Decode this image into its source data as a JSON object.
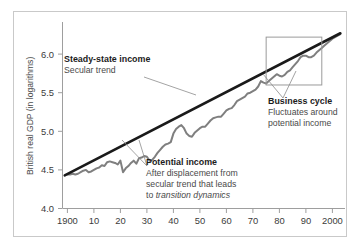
{
  "figure": {
    "background": "#ffffff",
    "frame_color": "#c9c9c9"
  },
  "chart_data": {
    "type": "line",
    "title": "",
    "xlabel": "",
    "ylabel": "British real GDP (in logarithms)",
    "xlim": [
      1897,
      2004
    ],
    "ylim": [
      4.0,
      6.35
    ],
    "grid": false,
    "legend": "none",
    "xticks": [
      1900,
      1910,
      1920,
      1930,
      1940,
      1950,
      1960,
      1970,
      1980,
      1990,
      2000
    ],
    "xtick_labels": [
      "1900",
      "10",
      "20",
      "30",
      "40",
      "50",
      "60",
      "70",
      "80",
      "90",
      "2000"
    ],
    "yticks": [
      4.0,
      4.5,
      5.0,
      5.5,
      6.0
    ],
    "ytick_labels": [
      "4.0",
      "4.5",
      "5.0",
      "5.5",
      "6.0"
    ],
    "series": [
      {
        "name": "Steady-state income",
        "type": "line",
        "color": "#1a1a1a",
        "width": 2.6,
        "x": [
          1899,
          2003
        ],
        "values": [
          4.43,
          6.27
        ]
      },
      {
        "name": "Potential income",
        "type": "line",
        "color": "#7f7f7f",
        "width": 2.0,
        "x": [
          1900,
          1901,
          1902,
          1903,
          1904,
          1905,
          1906,
          1907,
          1908,
          1909,
          1910,
          1911,
          1912,
          1913,
          1914,
          1915,
          1916,
          1917,
          1918,
          1919,
          1920,
          1921,
          1922,
          1923,
          1924,
          1925,
          1926,
          1927,
          1928,
          1929,
          1930,
          1931,
          1932,
          1933,
          1934,
          1935,
          1936,
          1937,
          1938,
          1939,
          1940,
          1941,
          1942,
          1943,
          1944,
          1945,
          1946,
          1947,
          1948,
          1949,
          1950,
          1951,
          1952,
          1953,
          1954,
          1955,
          1956,
          1957,
          1958,
          1959,
          1960,
          1961,
          1962,
          1963,
          1964,
          1965,
          1966,
          1967,
          1968,
          1969,
          1970,
          1971,
          1972,
          1973,
          1974,
          1975,
          1976,
          1977,
          1978,
          1979,
          1980,
          1981,
          1982,
          1983,
          1984,
          1985,
          1986,
          1987,
          1988,
          1989,
          1990,
          1991,
          1992,
          1993,
          1994,
          1995,
          1996,
          1997,
          1998,
          1999,
          2000,
          2001,
          2002,
          2003
        ],
        "values": [
          4.44,
          4.44,
          4.45,
          4.44,
          4.45,
          4.47,
          4.49,
          4.5,
          4.47,
          4.48,
          4.5,
          4.52,
          4.53,
          4.56,
          4.55,
          4.6,
          4.61,
          4.6,
          4.59,
          4.57,
          4.62,
          4.47,
          4.52,
          4.55,
          4.59,
          4.62,
          4.58,
          4.65,
          4.66,
          4.68,
          4.67,
          4.62,
          4.63,
          4.67,
          4.72,
          4.76,
          4.8,
          4.83,
          4.84,
          4.86,
          4.97,
          5.03,
          5.06,
          5.08,
          5.04,
          4.97,
          4.94,
          4.93,
          4.98,
          5.01,
          5.04,
          5.06,
          5.06,
          5.1,
          5.14,
          5.17,
          5.18,
          5.19,
          5.19,
          5.23,
          5.27,
          5.29,
          5.3,
          5.34,
          5.39,
          5.41,
          5.43,
          5.45,
          5.49,
          5.5,
          5.52,
          5.54,
          5.58,
          5.65,
          5.63,
          5.62,
          5.65,
          5.68,
          5.71,
          5.74,
          5.72,
          5.71,
          5.73,
          5.77,
          5.79,
          5.83,
          5.87,
          5.91,
          5.96,
          5.98,
          5.98,
          5.96,
          5.96,
          5.98,
          6.02,
          6.05,
          6.08,
          6.11,
          6.14,
          6.17,
          6.2,
          6.22,
          6.24,
          6.26
        ]
      }
    ],
    "annotations": [
      {
        "id": "steady-state",
        "title": "Steady-state income",
        "lines": [
          "Secular trend"
        ],
        "italic_lines": []
      },
      {
        "id": "potential-income",
        "title": "Potential income",
        "lines": [
          "After displacement from",
          "secular trend that leads",
          "to "
        ],
        "italic_tail": "transition dynamics"
      },
      {
        "id": "business-cycle",
        "title": "Business cycle",
        "lines": [
          "Fluctuates around",
          "potential income"
        ],
        "italic_lines": []
      }
    ],
    "highlight_box": {
      "name": "business-cycle-highlight",
      "x_range": [
        1975,
        1996
      ],
      "y_range": [
        5.6,
        6.22
      ],
      "color": "#9a9a9a"
    }
  }
}
